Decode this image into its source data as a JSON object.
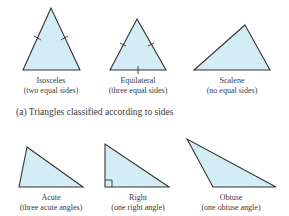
{
  "colors": {
    "fill": "#d4ecf5",
    "stroke": "#333333",
    "text": "#3a3a3a"
  },
  "section_a": {
    "caption": "(a) Triangles classified according to sides",
    "triangles": [
      {
        "name": "Isosceles",
        "desc": "(two equal sides)",
        "points": "51,8 23,70 80,70",
        "label_x": 51
      },
      {
        "name": "Equilateral",
        "desc": "(three equal sides)",
        "points": "137,19 110,70 166,70",
        "label_x": 138
      },
      {
        "name": "Scalene",
        "desc": "(no equal sides)",
        "points": "245,25 194,70 270,70",
        "label_x": 232
      }
    ]
  },
  "section_b": {
    "triangles": [
      {
        "name": "Acute",
        "desc": "(three acute angles)",
        "points": "27,147 19,187 83,187",
        "label_x": 51
      },
      {
        "name": "Right",
        "desc": "(one right angle)",
        "points": "105,144 105,187 169,187",
        "label_x": 138
      },
      {
        "name": "Obtuse",
        "desc": "(one obtuse angle)",
        "points": "187,139 213,187 276,187",
        "label_x": 231
      }
    ]
  }
}
